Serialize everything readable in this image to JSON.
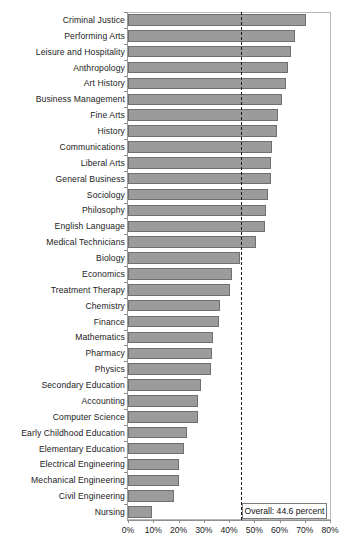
{
  "chart_data": {
    "type": "bar",
    "orientation": "horizontal",
    "title": "",
    "subtitle": "",
    "xlabel": "",
    "ylabel": "",
    "xlim": [
      0,
      80
    ],
    "xtick_labels": [
      "0%",
      "10%",
      "20%",
      "30%",
      "40%",
      "50%",
      "60%",
      "70%",
      "80%"
    ],
    "xtick_values": [
      0,
      10,
      20,
      30,
      40,
      50,
      60,
      70,
      80
    ],
    "grid": false,
    "legend": "none",
    "bar_color": "#9b9b9b",
    "bar_edge_color": "#6f6f6f",
    "reference_line": {
      "value": 44.6,
      "style": "dashed",
      "color": "#1a1a1a",
      "label": "Overall: 44.6 percent"
    },
    "categories": [
      "Criminal Justice",
      "Performing Arts",
      "Leisure and Hospitality",
      "Anthropology",
      "Art History",
      "Business Management",
      "Fine Arts",
      "History",
      "Communications",
      "Liberal Arts",
      "General Business",
      "Sociology",
      "Philosophy",
      "English Language",
      "Medical Technicians",
      "Biology",
      "Economics",
      "Treatment Therapy",
      "Chemistry",
      "Finance",
      "Mathematics",
      "Pharmacy",
      "Physics",
      "Secondary Education",
      "Accounting",
      "Computer Science",
      "Early Childhood Education",
      "Elementary Education",
      "Electrical Engineering",
      "Mechanical Engineering",
      "Civil Engineering",
      "Nursing"
    ],
    "values": [
      70.4,
      66.1,
      64.6,
      63.2,
      62.6,
      61.0,
      59.6,
      59.2,
      57.2,
      56.8,
      56.6,
      55.3,
      54.6,
      54.3,
      50.8,
      44.2,
      41.0,
      40.4,
      36.4,
      36.0,
      33.8,
      33.4,
      33.0,
      29.0,
      27.8,
      27.6,
      23.4,
      22.0,
      20.2,
      20.0,
      18.4,
      9.4
    ]
  }
}
